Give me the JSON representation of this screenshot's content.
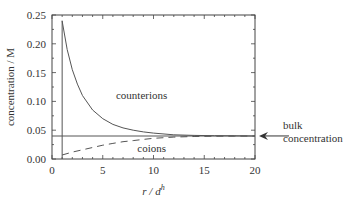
{
  "chart_data": {
    "type": "line",
    "title": "",
    "xlabel": "r / d^h",
    "xlabel_main": "r / d",
    "xlabel_sup": "h",
    "ylabel": "concentration / M",
    "xlim": [
      0,
      20
    ],
    "ylim": [
      0,
      0.25
    ],
    "x_ticks": [
      "0",
      "5",
      "10",
      "15",
      "20"
    ],
    "y_ticks": [
      "0.00",
      "0.05",
      "0.10",
      "0.15",
      "0.20",
      "0.25"
    ],
    "grid": false,
    "series": [
      {
        "name": "counterions",
        "style": "solid",
        "x": [
          1,
          1.5,
          2,
          2.5,
          3,
          4,
          5,
          6,
          7,
          8,
          9,
          10,
          12,
          14,
          16,
          18,
          20
        ],
        "values": [
          0.24,
          0.19,
          0.155,
          0.13,
          0.11,
          0.085,
          0.07,
          0.06,
          0.054,
          0.05,
          0.047,
          0.045,
          0.042,
          0.041,
          0.0405,
          0.0402,
          0.04
        ]
      },
      {
        "name": "coions",
        "style": "dashed",
        "x": [
          1,
          2,
          3,
          4,
          5,
          6,
          7,
          8,
          9,
          10,
          12,
          14,
          16,
          18,
          20
        ],
        "values": [
          0.007,
          0.012,
          0.016,
          0.02,
          0.024,
          0.027,
          0.03,
          0.032,
          0.034,
          0.036,
          0.038,
          0.039,
          0.0395,
          0.0398,
          0.04
        ]
      },
      {
        "name": "bulk concentration",
        "style": "solid-horizontal",
        "x": [
          0,
          20
        ],
        "values": [
          0.04,
          0.04
        ]
      }
    ],
    "vertical_line": {
      "x": 1,
      "from": 0,
      "to": 0.24
    },
    "annotations": [
      {
        "text": "counterions",
        "x": 6.3,
        "y": 0.105
      },
      {
        "text": "coions",
        "x": 8.5,
        "y": 0.018
      },
      {
        "text": "bulk concentration",
        "arrow_to_y": 0.04,
        "position": "right-outside"
      }
    ]
  },
  "labels": {
    "counterions": "counterions",
    "coions": "coions",
    "bulk_line1": "bulk",
    "bulk_line2": "concentration"
  }
}
